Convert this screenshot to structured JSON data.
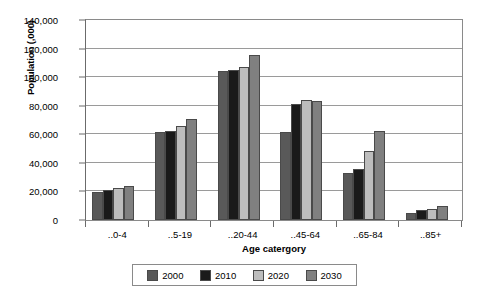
{
  "chart_data": {
    "type": "bar",
    "title": "",
    "xlabel": "Age catergory",
    "ylabel": "Population (,000)",
    "ylim": [
      0,
      140000
    ],
    "ytick_step": 20000,
    "grid": true,
    "legend_position": "bottom",
    "categories": [
      "..0-4",
      "..5-19",
      "..20-44",
      "..45-64",
      "..65-84",
      "..85+"
    ],
    "ytick_labels": [
      "140,000",
      "120,000",
      "100,000",
      "80,000",
      "60,000",
      "40,000",
      "20,000",
      "0"
    ],
    "ytick_values": [
      140000,
      120000,
      100000,
      80000,
      60000,
      40000,
      20000,
      0
    ],
    "series": [
      {
        "name": "2000",
        "color": "#595959",
        "values": [
          19500,
          61500,
          104500,
          61500,
          33000,
          5000
        ]
      },
      {
        "name": "2010",
        "color": "#1a1a1a",
        "values": [
          21000,
          62000,
          105000,
          81500,
          36000,
          6800
        ]
      },
      {
        "name": "2020",
        "color": "#bdbdbd",
        "values": [
          22500,
          66000,
          107000,
          84000,
          48000,
          8000
        ]
      },
      {
        "name": "2030",
        "color": "#808080",
        "values": [
          24000,
          70500,
          115500,
          83000,
          62500,
          10000
        ]
      }
    ]
  },
  "legend": {
    "entries": [
      {
        "label": "2000"
      },
      {
        "label": "2010"
      },
      {
        "label": "2020"
      },
      {
        "label": "2030"
      }
    ]
  }
}
